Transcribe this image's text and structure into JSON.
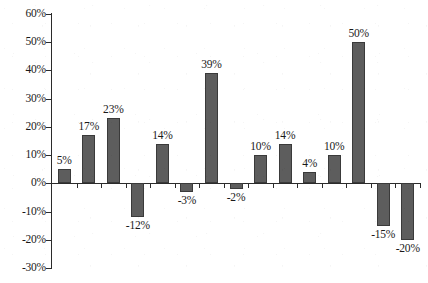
{
  "chart_data": {
    "type": "bar",
    "title": "",
    "subtitle": "",
    "xlabel": "",
    "ylabel": "",
    "ylim": [
      -30,
      60
    ],
    "y_tick_labels": [
      "60%",
      "50%",
      "40%",
      "30%",
      "20%",
      "10%",
      "0%",
      "-10%",
      "-20%",
      "-30%"
    ],
    "y_tick_values": [
      60,
      50,
      40,
      30,
      20,
      10,
      0,
      -10,
      -20,
      -30
    ],
    "grid": false,
    "legend": false,
    "legend_position": "none",
    "x_tick_labels": [
      "",
      "",
      "",
      "",
      "",
      "",
      "",
      "",
      "",
      "",
      "",
      "",
      "",
      "",
      ""
    ],
    "categories": [
      "1",
      "2",
      "3",
      "4",
      "5",
      "6",
      "7",
      "8",
      "9",
      "10",
      "11",
      "12",
      "13",
      "14",
      "15"
    ],
    "values": [
      5,
      17,
      23,
      -12,
      14,
      -3,
      39,
      -2,
      10,
      14,
      4,
      10,
      50,
      -15,
      -20
    ],
    "data_labels": [
      "5%",
      "17%",
      "23%",
      "-12%",
      "14%",
      "-3%",
      "39%",
      "-2%",
      "10%",
      "14%",
      "4%",
      "10%",
      "50%",
      "-15%",
      "-20%"
    ],
    "bar_color": "#5d5d5d",
    "bar_border_color": "#3a3a3a",
    "axis_color": "#2b2b2b",
    "background_color": "#ffffff"
  }
}
